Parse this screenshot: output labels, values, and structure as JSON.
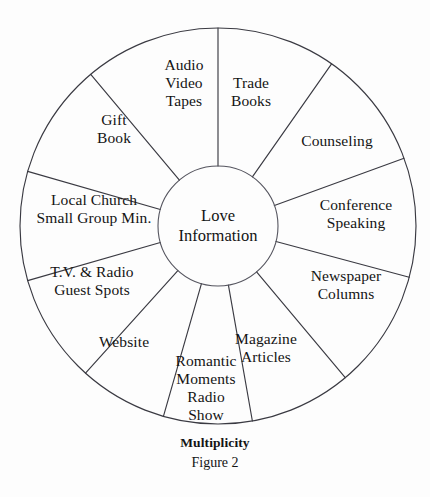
{
  "figure": {
    "caption_title": "Multiplicity",
    "caption_number": "Figure 2",
    "hub_label": "Love\nInformation",
    "background_color": "#fdfdfd",
    "line_color": "#3a3a42"
  },
  "chart_data": {
    "type": "pie",
    "title": "Multiplicity",
    "subtitle": "Figure 2",
    "center_label": "Love Information",
    "layout": {
      "center_x": 218,
      "center_y": 226,
      "outer_radius": 198,
      "hub_radius": 60,
      "grid": false,
      "legend": "none",
      "note": "12 radial sectors of unequal angular width around a central hub"
    },
    "categories": [
      "Trade Books",
      "Counseling",
      "Conference Speaking",
      "Newspaper Columns",
      "Magazine Articles",
      "Romantic Moments Radio Show",
      "Website",
      "T.V. & Radio Guest Spots",
      "Local Church Small Group Min.",
      "Gift Book",
      "Audio Video Tapes"
    ],
    "values": [
      35,
      35,
      35,
      35,
      30,
      26,
      26,
      32,
      32,
      34,
      30
    ],
    "xlabel": "",
    "ylabel": ""
  },
  "sectors": [
    {
      "id": "trade-books",
      "label": "Trade\nBooks",
      "start_angle": 0,
      "end_angle": 35,
      "label_x": 251,
      "label_y": 92
    },
    {
      "id": "counseling",
      "label": "Counseling",
      "start_angle": 35,
      "end_angle": 70,
      "label_x": 337,
      "label_y": 141
    },
    {
      "id": "conference-speaking",
      "label": "Conference\nSpeaking",
      "start_angle": 70,
      "end_angle": 105,
      "label_x": 356,
      "label_y": 214
    },
    {
      "id": "newspaper-columns",
      "label": "Newspaper\nColumns",
      "start_angle": 105,
      "end_angle": 140,
      "label_x": 346,
      "label_y": 285
    },
    {
      "id": "magazine-articles",
      "label": "Magazine\nArticles",
      "start_angle": 140,
      "end_angle": 170,
      "label_x": 266,
      "label_y": 348
    },
    {
      "id": "romantic-moments-radio-show",
      "label": "Romantic\nMoments\nRadio\nShow",
      "start_angle": 170,
      "end_angle": 196,
      "label_x": 206,
      "label_y": 388
    },
    {
      "id": "website",
      "label": "Website",
      "start_angle": 196,
      "end_angle": 222,
      "label_x": 124,
      "label_y": 342
    },
    {
      "id": "tv-radio-guest-spots",
      "label": "T.V. & Radio\nGuest Spots",
      "start_angle": 222,
      "end_angle": 254,
      "label_x": 92,
      "label_y": 281
    },
    {
      "id": "local-church-small-group-min",
      "label": "Local Church\nSmall Group Min.",
      "start_angle": 254,
      "end_angle": 286,
      "label_x": 94,
      "label_y": 209
    },
    {
      "id": "gift-book",
      "label": "Gift\nBook",
      "start_angle": 286,
      "end_angle": 320,
      "label_x": 114,
      "label_y": 129
    },
    {
      "id": "audio-video-tapes",
      "label": "Audio\nVideo\nTapes",
      "start_angle": 320,
      "end_angle": 360,
      "label_x": 184,
      "label_y": 83
    }
  ]
}
